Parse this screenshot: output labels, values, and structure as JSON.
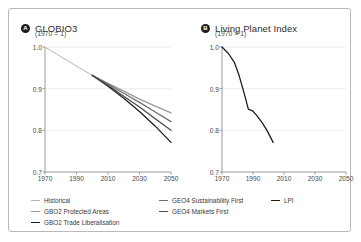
{
  "chart_data": [
    {
      "type": "line",
      "panel": "A",
      "title": "GLOBIO3",
      "subtitle": "(1970 = 1)",
      "xlabel": "",
      "ylabel": "",
      "xlim": [
        1970,
        2050
      ],
      "ylim": [
        0.7,
        1.0
      ],
      "xticks": [
        "1970",
        "1990",
        "2010",
        "2030",
        "2050"
      ],
      "yticks": [
        "0.7",
        "0.8",
        "0.9",
        "1.0"
      ],
      "grid": "horizontal-light",
      "legend_position": "bottom",
      "series": [
        {
          "name": "Historical",
          "color": "#b4b4b4",
          "x": [
            1970,
            1980,
            1990,
            2000
          ],
          "values": [
            1.0,
            0.977,
            0.954,
            0.932
          ]
        },
        {
          "name": "GBO2 Protected Areas",
          "color": "#9a9a9a",
          "x": [
            2000,
            2010,
            2020,
            2030,
            2040,
            2050
          ],
          "values": [
            0.932,
            0.913,
            0.894,
            0.875,
            0.858,
            0.842
          ]
        },
        {
          "name": "GBO2 Trade Liberalisation",
          "color": "#1d1d1d",
          "x": [
            2000,
            2010,
            2020,
            2030,
            2040,
            2050
          ],
          "values": [
            0.932,
            0.906,
            0.877,
            0.845,
            0.81,
            0.771
          ]
        },
        {
          "name": "GEO4 Sustainability First",
          "color": "#707070",
          "x": [
            2000,
            2010,
            2020,
            2030,
            2040,
            2050
          ],
          "values": [
            0.932,
            0.911,
            0.889,
            0.867,
            0.844,
            0.821
          ]
        },
        {
          "name": "GEO4 Markets First",
          "color": "#4a4a4a",
          "x": [
            2000,
            2010,
            2020,
            2030,
            2040,
            2050
          ],
          "values": [
            0.932,
            0.908,
            0.882,
            0.856,
            0.828,
            0.8
          ]
        }
      ]
    },
    {
      "type": "line",
      "panel": "B",
      "title": "Living Planet Index",
      "subtitle": "(1970 = 1)",
      "xlabel": "",
      "ylabel": "",
      "xlim": [
        1970,
        2050
      ],
      "ylim": [
        0.7,
        1.0
      ],
      "xticks": [
        "1970",
        "1990",
        "2010",
        "2030",
        "2050"
      ],
      "yticks": [
        "0.7",
        "0.8",
        "0.9",
        "1.0"
      ],
      "grid": "horizontal-light",
      "legend_position": "bottom",
      "series": [
        {
          "name": "LPI",
          "color": "#1d1d1d",
          "x": [
            1970,
            1974,
            1978,
            1981,
            1984,
            1987,
            1990,
            1993,
            1996,
            1999,
            2003
          ],
          "values": [
            1.0,
            0.985,
            0.963,
            0.932,
            0.893,
            0.851,
            0.846,
            0.833,
            0.818,
            0.8,
            0.771
          ]
        }
      ]
    }
  ],
  "panels": [
    {
      "marker": "A",
      "title": "GLOBIO3",
      "subtitle": "(1970 = 1)",
      "xticks": [
        "1970",
        "1990",
        "2010",
        "2030",
        "2050"
      ],
      "yticks": [
        "1.0",
        "0.9",
        "0.8",
        "0.7"
      ]
    },
    {
      "marker": "B",
      "title": "Living Planet Index",
      "subtitle": "(1970 = 1)",
      "xticks": [
        "1970",
        "1990",
        "2010",
        "2030",
        "2050"
      ],
      "yticks": [
        "1.0",
        "0.9",
        "0.8",
        "0.7"
      ]
    }
  ],
  "legend": {
    "column1": [
      {
        "label": "Historical",
        "color": "#b4b4b4",
        "width": "1px"
      },
      {
        "label": "GBO2 Protected Areas",
        "color": "#9a9a9a",
        "width": "1px"
      },
      {
        "label": "GBO2 Trade Liberalisation",
        "color": "#1d1d1d",
        "width": "1.4px"
      }
    ],
    "column2": [
      {
        "label": "GEO4 Sustainability First",
        "color": "#707070",
        "width": "1.4px"
      },
      {
        "label": "GEO4 Markets First",
        "color": "#4a4a4a",
        "width": "1.4px"
      }
    ],
    "column3": [
      {
        "label": "LPI",
        "color": "#1d1d1d",
        "width": "1.4px"
      }
    ]
  },
  "colors": {
    "axis": "#9b9b9b",
    "grid": "#ececec",
    "text": "#3a3a3a",
    "frame": "#b9b9b9",
    "marker_bg": "#1d1d1d"
  }
}
